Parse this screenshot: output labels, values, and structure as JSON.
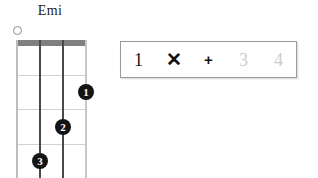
{
  "chord": {
    "name": "Emi",
    "strings": 4,
    "frets": 4,
    "open_markers": [
      {
        "string": 1,
        "symbol": "open-circle"
      }
    ],
    "fingerings": [
      {
        "finger": "1",
        "string": 4,
        "fret": 2
      },
      {
        "finger": "2",
        "string": 3,
        "fret": 3
      },
      {
        "finger": "3",
        "string": 2,
        "fret": 4
      }
    ]
  },
  "rhythm": {
    "beats": [
      {
        "label": "1",
        "state": "active",
        "kind": "number"
      },
      {
        "label": "✕",
        "state": "active",
        "kind": "strum"
      },
      {
        "label": "+",
        "state": "active",
        "kind": "plus"
      },
      {
        "label": "3",
        "state": "inactive",
        "kind": "number"
      },
      {
        "label": "4",
        "state": "inactive",
        "kind": "number"
      }
    ]
  },
  "colors": {
    "nut": "#808080",
    "fret_line": "#d2d2d2",
    "string": "#4a4a4a",
    "dot_fill": "#141414",
    "dot_text": "#ffffff",
    "active_text": "#1a1a1a",
    "inactive_text": "#cccccc",
    "panel_border": "#9a9a9a",
    "background": "#ffffff"
  }
}
